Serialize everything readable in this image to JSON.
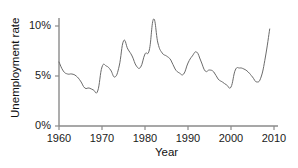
{
  "chart_data": {
    "type": "line",
    "title": "",
    "xlabel": "Year",
    "ylabel": "Unemployment rate",
    "xlim": [
      1960,
      2010
    ],
    "ylim": [
      0,
      11.2
    ],
    "grid": false,
    "legend": "none",
    "line_color": "#6b6b6b",
    "axis_color": "#8a8a8a",
    "text_color": "#1a1a1a",
    "xticks": [
      1960,
      1970,
      1980,
      1990,
      2000,
      2010
    ],
    "xtick_labels": [
      "1960",
      "1970",
      "1980",
      "1990",
      "2000",
      "2010"
    ],
    "yticks": [
      0,
      5,
      10
    ],
    "ytick_labels": [
      "0%",
      "5%",
      "10%"
    ],
    "series": [
      {
        "name": "Unemployment rate",
        "x": [
          1960,
          1961,
          1962,
          1963,
          1964,
          1965,
          1966,
          1967,
          1968,
          1969,
          1970,
          1971,
          1972,
          1973,
          1974,
          1975,
          1976,
          1977,
          1978,
          1979,
          1980,
          1981,
          1982,
          1983,
          1984,
          1985,
          1986,
          1987,
          1988,
          1989,
          1990,
          1991,
          1992,
          1993,
          1994,
          1995,
          1996,
          1997,
          1998,
          1999,
          2000,
          2001,
          2002,
          2003,
          2004,
          2005,
          2006,
          2007,
          2008,
          2009
        ],
        "values": [
          6.4,
          5.5,
          5.2,
          5.2,
          5.0,
          4.5,
          3.8,
          3.8,
          3.6,
          3.5,
          5.9,
          6.0,
          5.6,
          4.9,
          6.0,
          8.5,
          7.7,
          7.0,
          6.0,
          5.9,
          7.2,
          7.6,
          10.7,
          8.3,
          7.3,
          7.0,
          6.6,
          5.7,
          5.3,
          5.2,
          6.3,
          7.0,
          7.4,
          6.5,
          5.5,
          5.6,
          5.4,
          4.7,
          4.4,
          4.1,
          3.9,
          5.6,
          5.8,
          5.7,
          5.4,
          4.9,
          4.4,
          4.9,
          6.9,
          9.7
        ]
      }
    ]
  },
  "axes": {
    "y_title": "Unemployment rate",
    "x_title": "Year"
  }
}
